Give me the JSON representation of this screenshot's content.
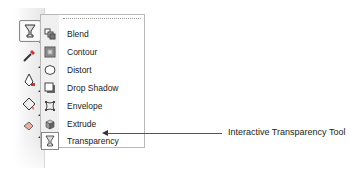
{
  "toolbox": {
    "tools": [
      {
        "name": "interactive-transparency-tool",
        "icon": "goblet-icon",
        "active": true
      },
      {
        "name": "eyedropper-tool",
        "icon": "eyedropper-icon",
        "active": false
      },
      {
        "name": "outline-tool",
        "icon": "pen-nib-icon",
        "active": false
      },
      {
        "name": "fill-tool",
        "icon": "paint-bucket-icon",
        "active": false
      },
      {
        "name": "interactive-fill-tool",
        "icon": "interactive-fill-icon",
        "active": false
      }
    ]
  },
  "flyout": {
    "items": [
      {
        "label": "Blend",
        "icon": "blend-icon"
      },
      {
        "label": "Contour",
        "icon": "contour-icon"
      },
      {
        "label": "Distort",
        "icon": "distort-icon"
      },
      {
        "label": "Drop Shadow",
        "icon": "drop-shadow-icon"
      },
      {
        "label": "Envelope",
        "icon": "envelope-icon"
      },
      {
        "label": "Extrude",
        "icon": "extrude-icon"
      },
      {
        "label": "Transparency",
        "icon": "transparency-icon"
      }
    ]
  },
  "callout": {
    "text": "Interactive Transparency Tool"
  }
}
